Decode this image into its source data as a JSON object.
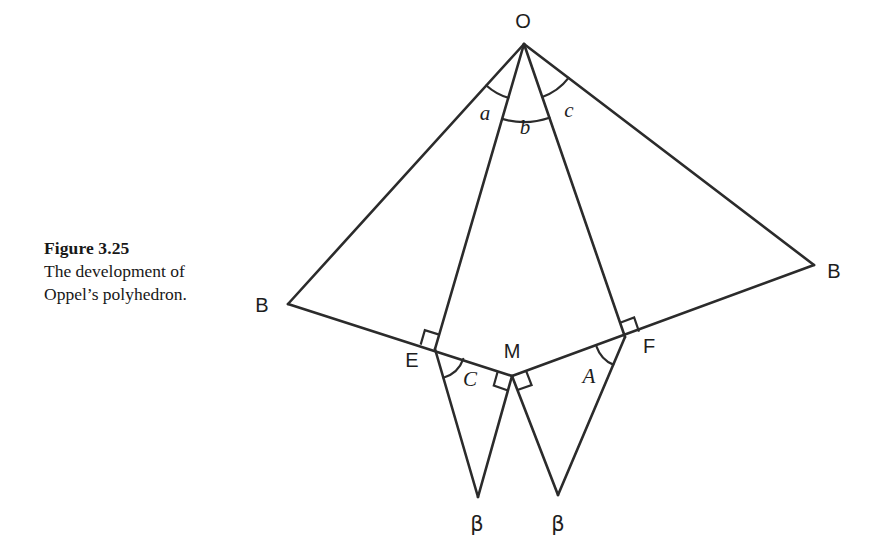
{
  "figure": {
    "caption_title": "Figure 3.25",
    "caption_line1": "The development of",
    "caption_line2": "Oppel’s polyhedron.",
    "ink_color": "#2b2b2b",
    "text_color": "#1d1d1d",
    "background_color": "#ffffff"
  },
  "diagram_data": {
    "type": "geometric-net",
    "description": "Planar development (net) of Oppel’s polyhedron: an apex O with four rays to B, E, F, B forming three adjacent triangles, plus two pendant triangles hanging below the folded baseline at E–M and M–F.",
    "vertices": [
      {
        "id": "O",
        "label": "O",
        "x": 524,
        "y": 44,
        "label_x": 523,
        "label_y": 28
      },
      {
        "id": "Bleft",
        "label": "B",
        "x": 288,
        "y": 304,
        "label_x": 262,
        "label_y": 312
      },
      {
        "id": "Bright",
        "label": "B",
        "x": 814,
        "y": 265,
        "label_x": 834,
        "label_y": 278
      },
      {
        "id": "E",
        "label": "E",
        "x": 435,
        "y": 349,
        "label_x": 412,
        "label_y": 367
      },
      {
        "id": "M",
        "label": "M",
        "x": 512,
        "y": 376,
        "label_x": 512,
        "label_y": 358
      },
      {
        "id": "F",
        "label": "F",
        "x": 625,
        "y": 337,
        "label_x": 649,
        "label_y": 353
      },
      {
        "id": "BetaLeft",
        "label": "β",
        "x": 478,
        "y": 497,
        "label_x": 477,
        "label_y": 531
      },
      {
        "id": "BetaRight",
        "label": "β",
        "x": 558,
        "y": 495,
        "label_x": 558,
        "label_y": 531
      }
    ],
    "edges": [
      {
        "from": "O",
        "to": "Bleft"
      },
      {
        "from": "O",
        "to": "E"
      },
      {
        "from": "O",
        "to": "F"
      },
      {
        "from": "O",
        "to": "Bright"
      },
      {
        "from": "Bleft",
        "to": "M",
        "through": "E"
      },
      {
        "from": "M",
        "to": "Bright",
        "through": "F"
      },
      {
        "from": "E",
        "to": "BetaLeft"
      },
      {
        "from": "BetaLeft",
        "to": "M"
      },
      {
        "from": "M",
        "to": "BetaRight"
      },
      {
        "from": "BetaRight",
        "to": "F"
      }
    ],
    "angle_marks": [
      {
        "id": "a",
        "label": "a",
        "at": "O",
        "between": [
          "Bleft",
          "E"
        ],
        "label_x": 485,
        "label_y": 120,
        "style": "italic"
      },
      {
        "id": "b",
        "label": "b",
        "at": "O",
        "between": [
          "E",
          "F"
        ],
        "label_x": 525,
        "label_y": 134,
        "style": "italic"
      },
      {
        "id": "c",
        "label": "c",
        "at": "O",
        "between": [
          "F",
          "Bright"
        ],
        "label_x": 569,
        "label_y": 117,
        "style": "italic"
      },
      {
        "id": "C",
        "label": "C",
        "at": "E",
        "between": [
          "BetaLeft",
          "M"
        ],
        "label_x": 470,
        "label_y": 386,
        "style": "italic"
      },
      {
        "id": "A",
        "label": "A",
        "at": "F",
        "between": [
          "M",
          "BetaRight"
        ],
        "label_x": 589,
        "label_y": 383,
        "style": "italic"
      }
    ],
    "right_angle_marks": [
      {
        "at": "E",
        "between": [
          "Bleft",
          "O"
        ],
        "note": "OE perpendicular to baseline BE"
      },
      {
        "at": "F",
        "between": [
          "O",
          "Bright"
        ],
        "note": "OF perpendicular to baseline FB"
      },
      {
        "at": "M",
        "between": [
          "E",
          "BetaLeft"
        ],
        "note": "M-beta-left perpendicular to EM"
      },
      {
        "at": "M",
        "between": [
          "BetaRight",
          "F"
        ],
        "note": "M-beta-right perpendicular to MF"
      }
    ]
  }
}
